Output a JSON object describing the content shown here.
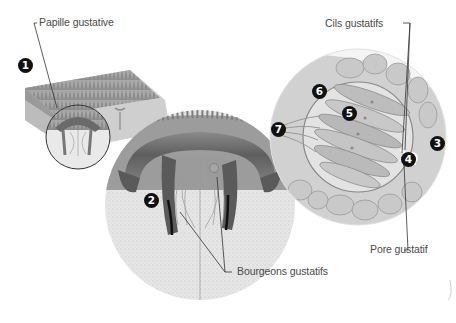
{
  "diagram": {
    "labels": {
      "papille": "Papille gustative",
      "cils": "Cils gustatifs",
      "pore": "Pore gustatif",
      "bourgeons": "Bourgeons gustatifs"
    },
    "markers": [
      {
        "id": "1",
        "text": "1"
      },
      {
        "id": "2",
        "text": "2"
      },
      {
        "id": "3",
        "text": "3"
      },
      {
        "id": "4",
        "text": "4"
      },
      {
        "id": "5",
        "text": "5"
      },
      {
        "id": "6",
        "text": "6"
      },
      {
        "id": "7",
        "text": "7"
      }
    ],
    "colors": {
      "marker_fill": "#111111",
      "marker_text": "#ffffff",
      "label_text": "#4a4a4a",
      "leader_line": "#333333",
      "tissue_dark": "#6e6e6e",
      "tissue_mid": "#9a9a9a",
      "tissue_light": "#d6d6d6"
    }
  }
}
